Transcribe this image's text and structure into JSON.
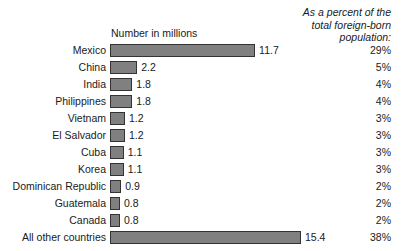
{
  "chart_data": {
    "type": "bar",
    "title": "Number in millions",
    "xlabel": "",
    "ylabel": "",
    "orientation": "horizontal",
    "grid": false,
    "legend": null,
    "xlim": [
      0,
      16
    ],
    "percent_header": "As a percent of the\ntotal foreign-born\npopulation:",
    "categories": [
      "Mexico",
      "China",
      "India",
      "Philippines",
      "Vietnam",
      "El Salvador",
      "Cuba",
      "Korea",
      "Dominican Republic",
      "Guatemala",
      "Canada",
      "All other countries"
    ],
    "values": [
      11.7,
      2.2,
      1.8,
      1.8,
      1.2,
      1.2,
      1.1,
      1.1,
      0.9,
      0.8,
      0.8,
      15.4
    ],
    "value_labels": [
      "11.7",
      "2.2",
      "1.8",
      "1.8",
      "1.2",
      "1.2",
      "1.1",
      "1.1",
      "0.9",
      "0.8",
      "0.8",
      "15.4"
    ],
    "percent_labels": [
      "29%",
      "5%",
      "4%",
      "4%",
      "3%",
      "3%",
      "3%",
      "3%",
      "2%",
      "2%",
      "2%",
      "38%"
    ],
    "bar_color": "#808080",
    "bar_border_color": "#333333",
    "background_color": "#ffffff",
    "text_color": "#1a1a1a"
  }
}
